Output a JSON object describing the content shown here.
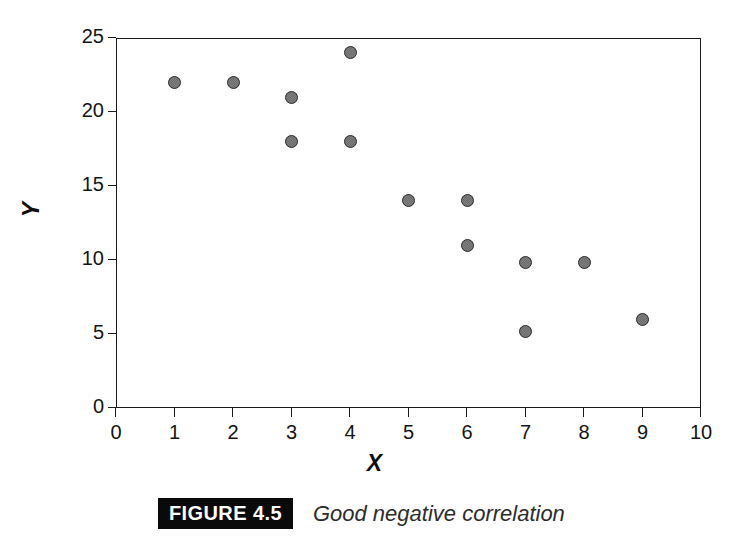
{
  "figure": {
    "tag": "FIGURE 4.5",
    "caption": "Good negative correlation"
  },
  "chart_data": {
    "type": "scatter",
    "title": "",
    "xlabel": "X",
    "ylabel": "Y",
    "xlim": [
      0,
      10
    ],
    "ylim": [
      0,
      25
    ],
    "xticks": [
      0,
      1,
      2,
      3,
      4,
      5,
      6,
      7,
      8,
      9,
      10
    ],
    "yticks": [
      0,
      5,
      10,
      15,
      20,
      25
    ],
    "xtick_labels": [
      "0",
      "1",
      "2",
      "3",
      "4",
      "5",
      "6",
      "7",
      "8",
      "9",
      "10"
    ],
    "ytick_labels": [
      "0",
      "5",
      "10",
      "15",
      "20",
      "25"
    ],
    "grid": false,
    "legend": null,
    "marker": {
      "shape": "circle",
      "fill_color": "#7d7d7d",
      "edge_color": "#2b2b2b",
      "size_px": 13
    },
    "frame_color": "#1a1a1a",
    "background": "#ffffff",
    "points": [
      {
        "x": 1,
        "y": 22
      },
      {
        "x": 2,
        "y": 22
      },
      {
        "x": 3,
        "y": 21
      },
      {
        "x": 3,
        "y": 18
      },
      {
        "x": 4,
        "y": 24
      },
      {
        "x": 4,
        "y": 18
      },
      {
        "x": 5,
        "y": 14
      },
      {
        "x": 6,
        "y": 14
      },
      {
        "x": 6,
        "y": 11
      },
      {
        "x": 7,
        "y": 9.8
      },
      {
        "x": 7,
        "y": 5.2
      },
      {
        "x": 8,
        "y": 9.8
      },
      {
        "x": 9,
        "y": 6
      }
    ]
  }
}
